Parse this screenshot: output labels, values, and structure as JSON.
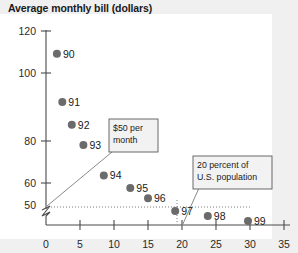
{
  "chart_data": {
    "type": "scatter",
    "title": "Average monthly bill (dollars)",
    "xlabel": "",
    "ylabel": "Average monthly bill (dollars)",
    "xlim": [
      0,
      35
    ],
    "ylim": [
      50,
      120
    ],
    "y_axis_break": true,
    "y_break_note": "axis broken between 0 and 50",
    "grid": false,
    "legend": "none",
    "x_ticks": [
      "0",
      "5",
      "10",
      "15",
      "20",
      "25",
      "30",
      "35"
    ],
    "y_ticks": [
      "0",
      "50",
      "60",
      "80",
      "100",
      "120"
    ],
    "point_label_key": "year",
    "points": [
      {
        "label": "90",
        "x": 1.6,
        "y": 111
      },
      {
        "label": "91",
        "x": 2.4,
        "y": 92
      },
      {
        "label": "92",
        "x": 3.8,
        "y": 83
      },
      {
        "label": "93",
        "x": 5.5,
        "y": 75
      },
      {
        "label": "94",
        "x": 8.5,
        "y": 63
      },
      {
        "label": "95",
        "x": 12.4,
        "y": 58
      },
      {
        "label": "96",
        "x": 15.0,
        "y": 54
      },
      {
        "label": "97",
        "x": 19.0,
        "y": 49
      },
      {
        "label": "98",
        "x": 23.8,
        "y": 47
      },
      {
        "label": "99",
        "x": 29.7,
        "y": 45
      }
    ],
    "annotations": [
      {
        "name": "fifty-dollar-per-month",
        "text_line1": "$50 per",
        "text_line2": "month"
      },
      {
        "name": "twenty-percent-population",
        "text_line1": "20 percent of",
        "text_line2": "U.S. population"
      }
    ]
  },
  "colors": {
    "dot": "#6b6b6b",
    "axis": "#4a4a4a",
    "plot_background": "#ffffff",
    "page_background": "#f0f0f0",
    "annotation_box": "#f2f2f2",
    "text": "#1a1a1a"
  }
}
